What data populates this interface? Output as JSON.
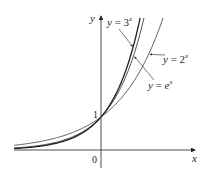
{
  "chart_data": {
    "type": "line",
    "title": "",
    "xlabel": "x",
    "ylabel": "y",
    "xlim": [
      -2.8,
      3.0
    ],
    "ylim": [
      -0.55,
      4.0
    ],
    "grid": false,
    "legend": "inline annotations with arrows",
    "tick_labels": {
      "origin": "0",
      "y_intercept": "1"
    },
    "series": [
      {
        "name": "y = 3^x",
        "label_main": "y = 3",
        "label_exp": "x",
        "base": 3,
        "stroke": "#231f20",
        "width": 1.3
      },
      {
        "name": "y = e^x",
        "label_main": "y = e",
        "label_exp": "x",
        "base": 2.718281828,
        "stroke": "#231f20",
        "width": 0.8
      },
      {
        "name": "y = 2^x",
        "label_main": "y = 2",
        "label_exp": "x",
        "base": 2,
        "stroke": "#231f20",
        "width": 0.7
      }
    ],
    "annotations": [
      {
        "series": "y = 3^x",
        "text": "y = 3^x",
        "label_pos": [
          107,
          26
        ],
        "arrow_to_x": 1.05
      },
      {
        "series": "y = e^x",
        "text": "y = e^x",
        "label_pos": [
          148,
          89
        ],
        "arrow_to_x": 1.05
      },
      {
        "series": "y = 2^x",
        "text": "y = 2^x",
        "label_pos": [
          163,
          63
        ],
        "arrow_to_x": 1.55
      }
    ],
    "common_point": {
      "x": 0,
      "y": 1
    }
  },
  "layout": {
    "origin_px": [
      101,
      150
    ],
    "x_unit_px": 31,
    "y_unit_px": 33,
    "x_axis": {
      "from": 14,
      "to": 195
    },
    "y_axis": {
      "from": 168,
      "to": 16
    }
  }
}
